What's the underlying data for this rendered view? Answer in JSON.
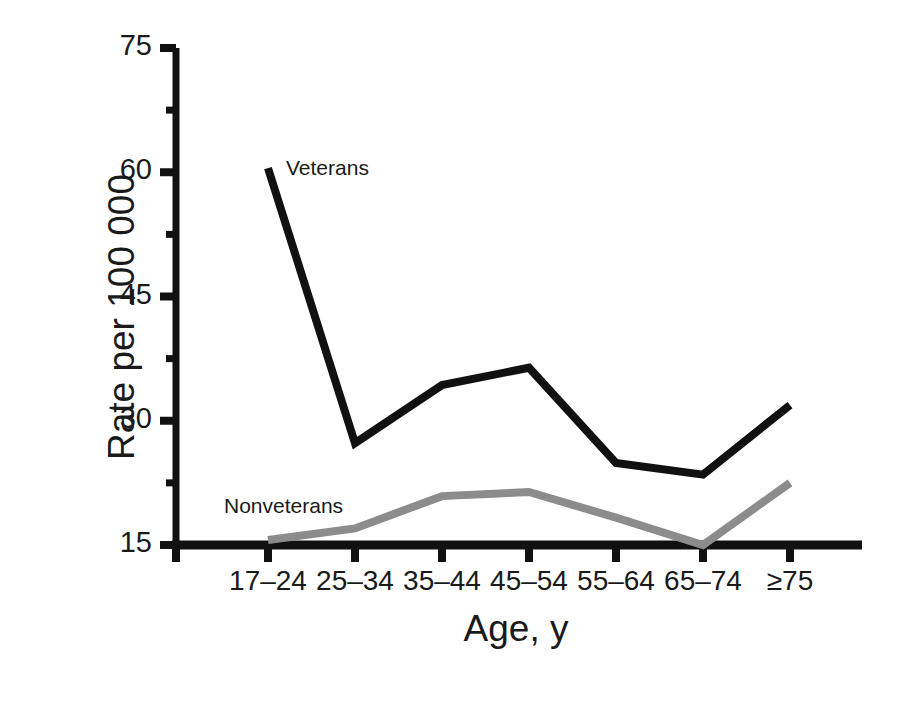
{
  "chart_data": {
    "type": "line",
    "title": "",
    "xlabel": "Age, y",
    "ylabel": "Rate per 100 000",
    "categories": [
      "17–24",
      "25–34",
      "35–44",
      "45–54",
      "55–64",
      "65–74",
      "≥75"
    ],
    "series": [
      {
        "name": "Veterans",
        "color": "#111111",
        "values": [
          60.5,
          27.3,
          34.3,
          36.4,
          24.9,
          23.5,
          31.9
        ]
      },
      {
        "name": "Nonveterans",
        "color": "#8c8c8c",
        "values": [
          15.6,
          17.0,
          20.9,
          21.4,
          18.3,
          15.0,
          22.5
        ]
      }
    ],
    "ylim": [
      15,
      75
    ],
    "y_ticks": [
      15,
      30,
      45,
      60,
      75
    ],
    "y_minor_ticks": [
      22.5,
      37.5,
      52.5,
      67.5
    ],
    "grid": false,
    "legend": "inline-labels",
    "axis_color": "#111111"
  },
  "axes": {
    "y_title": "Rate per 100 000",
    "x_title": "Age, y",
    "y_tick_labels": [
      "75",
      "60",
      "45",
      "30",
      "15"
    ],
    "x_tick_labels": [
      "17–24",
      "25–34",
      "35–44",
      "45–54",
      "55–64",
      "65–74",
      "≥75"
    ]
  },
  "annotations": {
    "veterans_label": "Veterans",
    "nonveterans_label": "Nonveterans"
  }
}
